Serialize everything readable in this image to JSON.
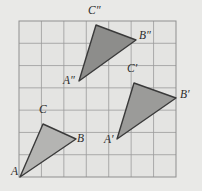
{
  "figure": {
    "background_color": "#e9e9e7",
    "grid": {
      "x0": 19,
      "y0": 21,
      "x1": 176,
      "y1": 177,
      "cols": 7,
      "rows": 7,
      "line_color": "#9a9a9a",
      "border_color": "#8f8f8f",
      "cell_fill": "#e4e4e2",
      "visible": true
    },
    "triangles": [
      {
        "name": "triangle-abc",
        "fill": "#b4b4b2",
        "stroke": "#3a3a3a",
        "stroke_width": 1.4,
        "vertices": [
          {
            "label": "A",
            "x": 20,
            "y": 177
          },
          {
            "label": "B",
            "x": 76,
            "y": 139
          },
          {
            "label": "C",
            "x": 43,
            "y": 124
          }
        ]
      },
      {
        "name": "triangle-a-prime-b-prime-c-prime",
        "fill": "#9b9b99",
        "stroke": "#3a3a3a",
        "stroke_width": 1.4,
        "vertices": [
          {
            "label": "A'",
            "x": 117,
            "y": 139
          },
          {
            "label": "B'",
            "x": 176,
            "y": 98
          },
          {
            "label": "C'",
            "x": 134,
            "y": 83
          }
        ]
      },
      {
        "name": "triangle-a-double-prime-b-double-prime-c-double-prime",
        "fill": "#8d8d8b",
        "stroke": "#3a3a3a",
        "stroke_width": 1.4,
        "vertices": [
          {
            "label": "A″",
            "x": 79,
            "y": 81
          },
          {
            "label": "B″",
            "x": 136,
            "y": 40
          },
          {
            "label": "C″",
            "x": 96,
            "y": 25
          }
        ]
      }
    ],
    "labels": [
      {
        "name": "vertex-label-A",
        "base": "A",
        "primes": "",
        "x": 11,
        "y": 177
      },
      {
        "name": "vertex-label-B",
        "base": "B",
        "primes": "",
        "x": 77,
        "y": 144
      },
      {
        "name": "vertex-label-C",
        "base": "C",
        "primes": "",
        "x": 39,
        "y": 115
      },
      {
        "name": "vertex-label-A-prime",
        "base": "A",
        "primes": "′",
        "x": 104,
        "y": 145
      },
      {
        "name": "vertex-label-B-prime",
        "base": "B",
        "primes": "′",
        "x": 180,
        "y": 100
      },
      {
        "name": "vertex-label-C-prime",
        "base": "C",
        "primes": "′",
        "x": 127,
        "y": 74
      },
      {
        "name": "vertex-label-A-double-prime",
        "base": "A",
        "primes": "″",
        "x": 63,
        "y": 86
      },
      {
        "name": "vertex-label-B-double-prime",
        "base": "B",
        "primes": "″",
        "x": 139,
        "y": 41
      },
      {
        "name": "vertex-label-C-double-prime",
        "base": "C",
        "primes": "″",
        "x": 88,
        "y": 16
      }
    ]
  }
}
